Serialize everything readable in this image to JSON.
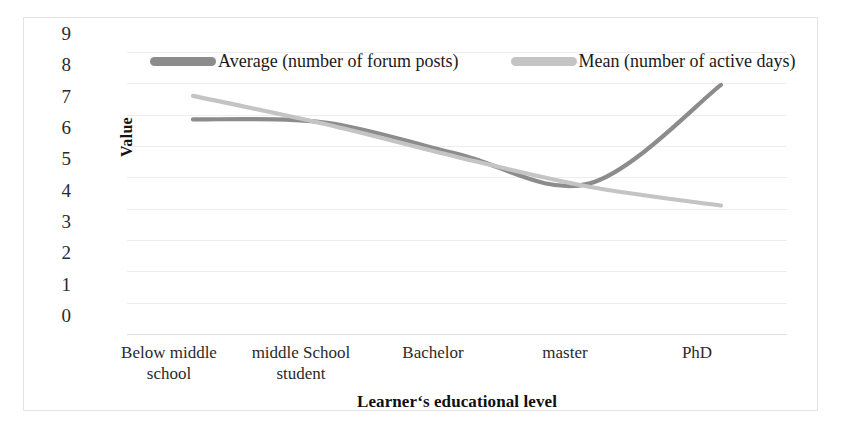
{
  "chart_data": {
    "type": "line",
    "title": "",
    "xlabel": "Learner‘s educational level",
    "ylabel": "Value",
    "categories": [
      "Below middle school",
      "middle School student",
      "Bachelor",
      "master",
      "PhD"
    ],
    "category_lines": [
      [
        "Below middle",
        "school"
      ],
      [
        "middle School",
        "student"
      ],
      [
        "Bachelor"
      ],
      [
        "master"
      ],
      [
        "PhD"
      ]
    ],
    "ylim": [
      0,
      9
    ],
    "yticks": [
      "9",
      "8",
      "7",
      "6",
      "5",
      "4",
      "3",
      "2",
      "1",
      "0"
    ],
    "ytick_values": [
      9,
      8,
      7,
      6,
      5,
      4,
      3,
      2,
      1,
      0
    ],
    "grid": true,
    "legend_position": "top-inside",
    "smoothing": "spline",
    "series": [
      {
        "name": "Average (number of forum posts)",
        "values": [
          6.85,
          6.75,
          5.75,
          4.8,
          7.95
        ],
        "color": "#8c8c8c"
      },
      {
        "name": "Mean (number of active days)",
        "values": [
          7.6,
          6.7,
          5.65,
          4.7,
          4.1
        ],
        "color": "#c4c4c4"
      }
    ]
  },
  "legend": {
    "entries": [
      {
        "label": "Average (number of forum posts)",
        "swatch_name": "legend-swatch-average"
      },
      {
        "label": "Mean (number of active days)",
        "swatch_name": "legend-swatch-mean"
      }
    ]
  },
  "axes": {
    "y_title": "Value",
    "x_title": "Learner‘s educational level"
  },
  "colors": {
    "series_average": "#8c8c8c",
    "series_mean": "#c4c4c4",
    "gridline": "#ededf0",
    "frame": "#e3e3e5",
    "text": "#2a2a2a"
  }
}
